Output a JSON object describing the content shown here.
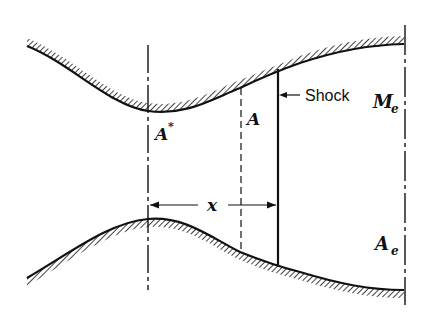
{
  "diagram": {
    "labels": {
      "throat_area": "A",
      "throat_area_sup": "*",
      "local_area": "A",
      "shock": "Shock",
      "exit_mach": "M",
      "exit_mach_sub": "e",
      "exit_area": "A",
      "exit_area_sub": "e",
      "distance": "x"
    },
    "colors": {
      "line": "#111111",
      "background": "#ffffff"
    }
  }
}
